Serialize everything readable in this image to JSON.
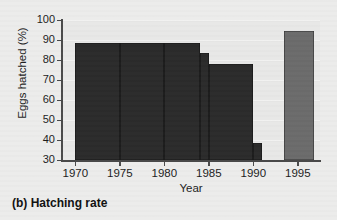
{
  "figure": {
    "caption": "(b) Hatching rate",
    "background_color": "#ececeb",
    "plot_background_color": "#e8e8e7"
  },
  "chart_data": {
    "type": "bar",
    "title": "(b) Hatching rate",
    "subtitle": "",
    "xlabel": "Year",
    "ylabel": "Eggs hatched (%)",
    "xlim": [
      1968.5,
      1997.5
    ],
    "ylim": [
      30,
      100
    ],
    "ytick_labels": [
      "30",
      "40",
      "50",
      "60",
      "70",
      "80",
      "90",
      "100"
    ],
    "yticks": [
      30,
      40,
      50,
      60,
      70,
      80,
      90,
      100
    ],
    "xtick_labels": [
      "1970",
      "1975",
      "1980",
      "1985",
      "1990",
      "1995"
    ],
    "xticks": [
      1970,
      1975,
      1980,
      1985,
      1990,
      1995
    ],
    "grid": "horizontal",
    "legend": "none",
    "style": "stepped histogram bars spanning year intervals",
    "bars": [
      {
        "label": "1970-1975",
        "x_start": 1970,
        "x_end": 1975,
        "value": 88.5,
        "color": "#2b2b2b"
      },
      {
        "label": "1975-1980",
        "x_start": 1975,
        "x_end": 1980,
        "value": 88.5,
        "color": "#2b2b2b"
      },
      {
        "label": "1980-1985",
        "x_start": 1980,
        "x_end": 1984,
        "value": 88.5,
        "color": "#2b2b2b"
      },
      {
        "label": "1984-1985",
        "x_start": 1984,
        "x_end": 1985,
        "value": 83.5,
        "color": "#2b2b2b"
      },
      {
        "label": "1985-1990",
        "x_start": 1985,
        "x_end": 1990,
        "value": 78.0,
        "color": "#2b2b2b"
      },
      {
        "label": "1990-1991",
        "x_start": 1990,
        "x_end": 1991,
        "value": 38.5,
        "color": "#2b2b2b"
      },
      {
        "label": "1994-1997",
        "x_start": 1993.5,
        "x_end": 1996.8,
        "value": 94.5,
        "color": "#6b6b6b"
      }
    ],
    "categories": [
      "1970",
      "1975",
      "1980",
      "1984",
      "1985",
      "1990",
      "1995"
    ],
    "values": [
      88.5,
      88.5,
      88.5,
      83.5,
      78.0,
      38.5,
      94.5
    ]
  },
  "colors": {
    "bar_dark": "#2b2b2b",
    "bar_light": "#6b6b6b",
    "axis": "#4a4a4a",
    "text": "#1d1d1d",
    "gridline": "#f4f4f3"
  }
}
